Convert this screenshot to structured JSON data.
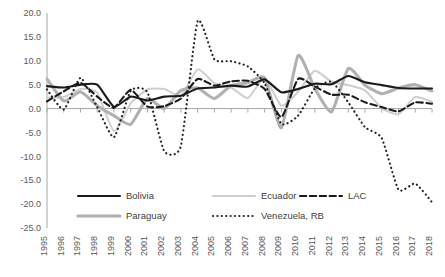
{
  "chart_data": {
    "type": "line",
    "title": "",
    "subtitle": "",
    "xlabel": "",
    "ylabel": "",
    "ylim": [
      -25.0,
      20.0
    ],
    "ytick_step": 5.0,
    "grid": false,
    "legend_position": "bottom",
    "yticks": [
      "20.0",
      "15.0",
      "10.0",
      "5.0",
      "0.0",
      "-5.0",
      "-10.0",
      "-15.0",
      "-20.0",
      "-25.0"
    ],
    "ytick_values": [
      20.0,
      15.0,
      10.0,
      5.0,
      0.0,
      -5.0,
      -10.0,
      -15.0,
      -20.0,
      -25.0
    ],
    "categories": [
      "1995",
      "1996",
      "1997",
      "1998",
      "1999",
      "2000",
      "2001",
      "2002",
      "2003",
      "2004",
      "2005",
      "2006",
      "2007",
      "2008",
      "2009",
      "2010",
      "2011",
      "2012",
      "2013",
      "2014",
      "2015",
      "2016",
      "2017",
      "2018"
    ],
    "x": [
      1995,
      1996,
      1997,
      1998,
      1999,
      2000,
      2001,
      2002,
      2003,
      2004,
      2005,
      2006,
      2007,
      2008,
      2009,
      2010,
      2011,
      2012,
      2013,
      2014,
      2015,
      2016,
      2017,
      2018
    ],
    "series": [
      {
        "name": "Bolivia",
        "color": "#1a1a1a",
        "style": "solid",
        "width": 2.1,
        "values": [
          4.7,
          4.4,
          5.0,
          5.0,
          0.4,
          2.5,
          1.7,
          2.5,
          2.7,
          4.2,
          4.4,
          4.8,
          4.6,
          6.1,
          3.4,
          4.1,
          5.2,
          5.1,
          6.8,
          5.5,
          4.9,
          4.3,
          4.2,
          4.2
        ]
      },
      {
        "name": "Ecuador",
        "color": "#cfcfcf",
        "style": "solid",
        "width": 2.1,
        "values": [
          2.3,
          2.4,
          4.1,
          3.3,
          -4.7,
          1.1,
          4.0,
          4.1,
          2.7,
          8.2,
          5.3,
          4.4,
          2.2,
          6.4,
          0.6,
          3.5,
          7.9,
          5.6,
          4.9,
          3.8,
          0.1,
          -1.2,
          2.4,
          1.4
        ]
      },
      {
        "name": "LAC",
        "color": "#1a1a1a",
        "style": "dashed",
        "width": 2.1,
        "values": [
          1.5,
          3.6,
          5.4,
          2.5,
          0.2,
          3.9,
          0.4,
          0.5,
          2.1,
          6.2,
          4.8,
          5.7,
          5.8,
          4.1,
          -1.8,
          6.2,
          4.6,
          2.9,
          2.9,
          1.3,
          0.3,
          -0.6,
          1.3,
          1.0
        ]
      },
      {
        "name": "Paraguay",
        "color": "#b0b0b0",
        "style": "solid",
        "width": 3.1,
        "values": [
          6.2,
          1.6,
          3.5,
          0.6,
          -1.5,
          -3.3,
          2.1,
          0.0,
          3.8,
          4.3,
          2.1,
          4.8,
          5.4,
          6.4,
          -4.0,
          11.1,
          4.2,
          -0.7,
          8.4,
          4.9,
          3.1,
          4.3,
          5.0,
          3.7
        ]
      },
      {
        "name": "Venezuela, RB",
        "color": "#222222",
        "style": "dotted",
        "width": 2.2,
        "values": [
          4.0,
          -0.2,
          6.4,
          0.3,
          -6.0,
          3.7,
          3.4,
          -8.9,
          -7.8,
          18.3,
          10.3,
          9.9,
          8.8,
          5.3,
          -3.2,
          -1.5,
          4.2,
          5.6,
          1.3,
          -3.9,
          -6.2,
          -17.0,
          -15.7,
          -19.6
        ]
      }
    ],
    "legend": [
      {
        "label": "Bolivia",
        "style": "solid",
        "color": "#1a1a1a"
      },
      {
        "label": "Ecuador",
        "style": "solid",
        "color": "#cfcfcf"
      },
      {
        "label": "LAC",
        "style": "dashed",
        "color": "#1a1a1a"
      },
      {
        "label": "Paraguay",
        "style": "solid",
        "color": "#b0b0b0"
      },
      {
        "label": "Venezuela, RB",
        "style": "dotted",
        "color": "#222222"
      }
    ]
  }
}
